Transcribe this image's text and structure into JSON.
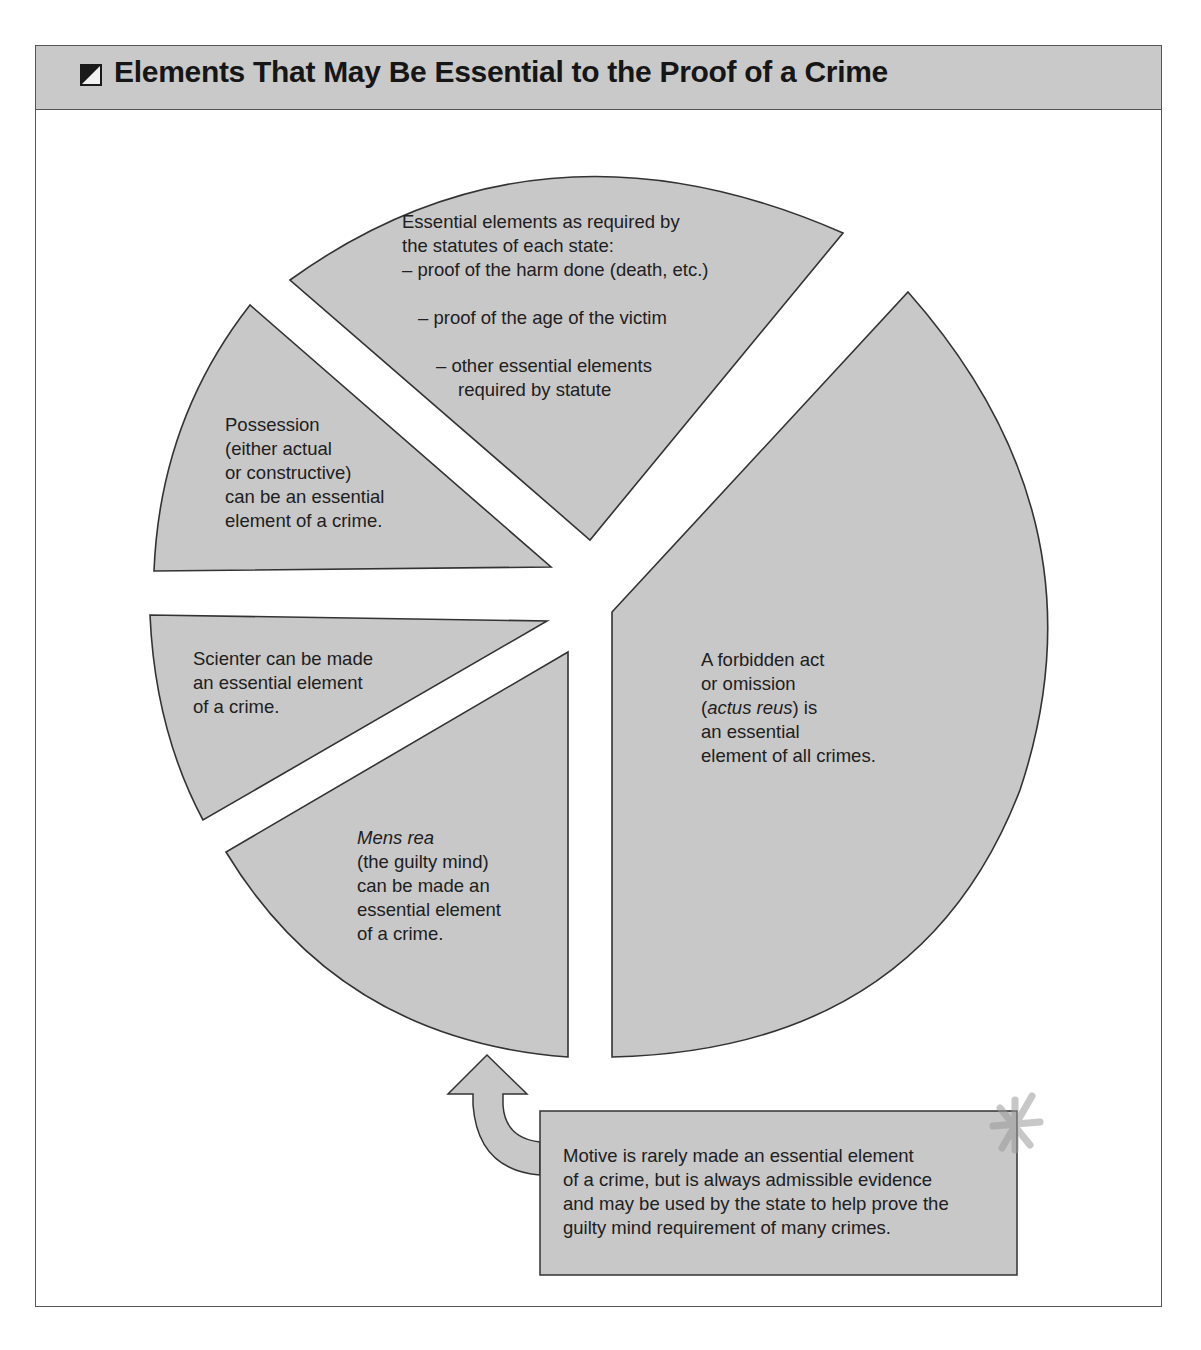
{
  "header": {
    "icon": "half-filled-square-icon",
    "title": "Elements That May Be Essential to the Proof of a Crime"
  },
  "colors": {
    "wedge_fill": "#c8c8c8",
    "wedge_stroke": "#333333",
    "header_fill": "#c9c9c9",
    "text": "#202020"
  },
  "wedges": {
    "statutory": {
      "lines": [
        "Essential elements as required by",
        "the statutes of each state:",
        "– proof of the harm done (death, etc.)",
        "– proof of the age of the victim",
        "– other essential elements",
        "required by statute"
      ]
    },
    "possession": {
      "lines": [
        "Possession",
        "(either actual",
        "or constructive)",
        "can be an essential",
        "element of a crime."
      ]
    },
    "scienter": {
      "lines": [
        "Scienter can be made",
        "an essential element",
        "of a crime."
      ]
    },
    "mens_rea": {
      "term": "Mens rea",
      "lines": [
        "(the guilty mind)",
        "can be made an",
        "essential element",
        "of a crime."
      ]
    },
    "actus_reus": {
      "line1": "A forbidden act",
      "line2": "or omission",
      "paren_open": "(",
      "term": "actus reus",
      "paren_close": ") is",
      "line4": "an essential",
      "line5": "element of all crimes."
    }
  },
  "motive_box": {
    "lines": [
      "Motive is rarely made an essential element",
      "of a crime, but is always admissible evidence",
      "and may be used by the state to help prove the",
      "guilty mind requirement of many crimes."
    ],
    "arrow_icon": "curved-up-arrow-icon"
  }
}
